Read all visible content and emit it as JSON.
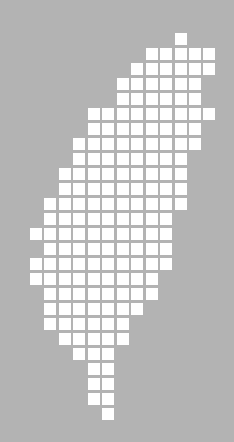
{
  "map": {
    "subject": "Taiwan tile grid map",
    "background_color": "#b3b3b3",
    "tile_color": "#ffffff",
    "tile_size": 12,
    "origin": {
      "x": 30,
      "y": 33
    },
    "col_pitch": 14.45,
    "row_pitch": 15,
    "rows": [
      {
        "row": 0,
        "from": 10,
        "to": 10
      },
      {
        "row": 1,
        "from": 8,
        "to": 12
      },
      {
        "row": 2,
        "from": 7,
        "to": 12
      },
      {
        "row": 3,
        "from": 6,
        "to": 11
      },
      {
        "row": 4,
        "from": 6,
        "to": 11
      },
      {
        "row": 5,
        "from": 4,
        "to": 12
      },
      {
        "row": 6,
        "from": 4,
        "to": 11
      },
      {
        "row": 7,
        "from": 3,
        "to": 11
      },
      {
        "row": 8,
        "from": 3,
        "to": 10
      },
      {
        "row": 9,
        "from": 2,
        "to": 10
      },
      {
        "row": 10,
        "from": 2,
        "to": 10
      },
      {
        "row": 11,
        "from": 1,
        "to": 10
      },
      {
        "row": 12,
        "from": 1,
        "to": 9
      },
      {
        "row": 13,
        "from": 0,
        "to": 9
      },
      {
        "row": 14,
        "from": 1,
        "to": 9
      },
      {
        "row": 15,
        "from": 0,
        "to": 9
      },
      {
        "row": 16,
        "from": 0,
        "to": 8
      },
      {
        "row": 17,
        "from": 1,
        "to": 8
      },
      {
        "row": 18,
        "from": 1,
        "to": 7
      },
      {
        "row": 19,
        "from": 1,
        "to": 6
      },
      {
        "row": 20,
        "from": 2,
        "to": 6
      },
      {
        "row": 21,
        "from": 3,
        "to": 5
      },
      {
        "row": 22,
        "from": 4,
        "to": 5
      },
      {
        "row": 23,
        "from": 4,
        "to": 5
      },
      {
        "row": 24,
        "from": 4,
        "to": 5
      },
      {
        "row": 25,
        "from": 5,
        "to": 5
      }
    ]
  }
}
